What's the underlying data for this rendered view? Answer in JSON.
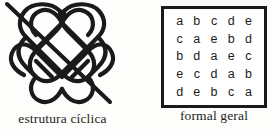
{
  "figures": {
    "knot": {
      "caption": "estrutura cíclica",
      "icon_name": "celtic-knot-icon",
      "stroke_color": "#1a1a1a"
    },
    "matrix": {
      "caption": "formal geral",
      "border_color": "#1a1a1a",
      "rows": [
        [
          "a",
          "b",
          "c",
          "d",
          "e"
        ],
        [
          "c",
          "a",
          "e",
          "b",
          "d"
        ],
        [
          "b",
          "d",
          "a",
          "e",
          "c"
        ],
        [
          "e",
          "c",
          "d",
          "a",
          "b"
        ],
        [
          "d",
          "e",
          "b",
          "c",
          "a"
        ]
      ]
    }
  }
}
